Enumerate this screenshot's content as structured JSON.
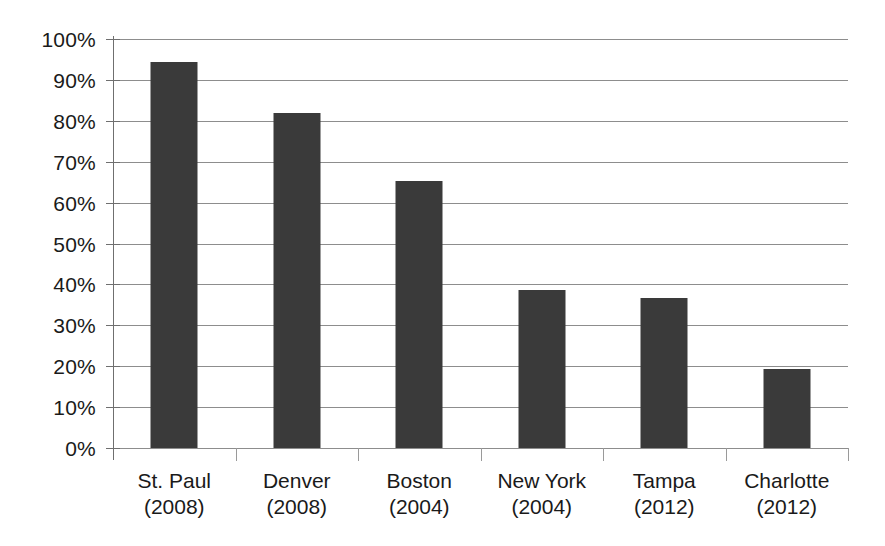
{
  "chart_data": {
    "type": "bar",
    "title": "",
    "subtitle": "",
    "xlabel": "",
    "ylabel": "",
    "categories": [
      "St. Paul (2008)",
      "Denver (2008)",
      "Boston (2004)",
      "New York (2004)",
      "Tampa (2012)",
      "Charlotte (2012)"
    ],
    "category_names": [
      "St. Paul",
      "Denver",
      "Boston",
      "New York",
      "Tampa",
      "Charlotte"
    ],
    "category_years": [
      "(2008)",
      "(2008)",
      "(2004)",
      "(2004)",
      "(2012)",
      "(2012)"
    ],
    "values": [
      94.5,
      81.8,
      65.3,
      38.6,
      36.7,
      19.4
    ],
    "value_unit": "%",
    "ylim": [
      0,
      100
    ],
    "y_tick_labels": [
      "100%",
      "90%",
      "80%",
      "70%",
      "60%",
      "50%",
      "40%",
      "30%",
      "20%",
      "10%",
      "0%"
    ],
    "y_tick_values": [
      100,
      90,
      80,
      70,
      60,
      50,
      40,
      30,
      20,
      10,
      0
    ],
    "grid": true,
    "legend": "none",
    "bar_color": "#3a3a3a",
    "gridline_color": "#8d8d8d",
    "axis_color": "#6f6f6f",
    "text_color": "#1a1a1a",
    "background_color": "#ffffff"
  }
}
